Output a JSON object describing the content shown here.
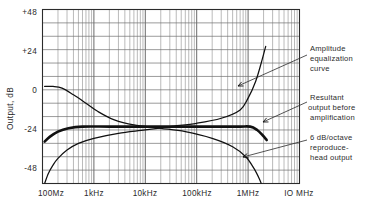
{
  "chart_data": {
    "type": "line",
    "title": "",
    "xlabel": "",
    "ylabel": "Output, dB",
    "x_scale": "log",
    "xlim": [
      100,
      10000000
    ],
    "ylim": [
      -56,
      48
    ],
    "y_major_step": 24,
    "y_minor_step": 8,
    "grid": true,
    "legend_position": "annotations-right",
    "x_tick_labels": [
      "100Mz",
      "1kHz",
      "10kHz",
      "100kHz",
      "1MHz",
      "IO MHz"
    ],
    "x_tick_values": [
      100,
      1000,
      10000,
      100000,
      1000000,
      10000000
    ],
    "y_tick_labels": [
      "+48",
      "+24",
      "0",
      "-24",
      "-48"
    ],
    "y_tick_values": [
      48,
      24,
      0,
      -24,
      -48
    ],
    "series": [
      {
        "name": "6 dB/octave reproduce-head output",
        "style": "thin",
        "points": [
          [
            110,
            -56
          ],
          [
            130,
            -50
          ],
          [
            160,
            -45
          ],
          [
            200,
            -41
          ],
          [
            300,
            -36
          ],
          [
            500,
            -32
          ],
          [
            1000,
            -29
          ],
          [
            3000,
            -26
          ],
          [
            10000,
            -24
          ],
          [
            30000,
            -22
          ],
          [
            100000,
            -20
          ],
          [
            300000,
            -17
          ],
          [
            700000,
            -12
          ],
          [
            1000000,
            -5
          ],
          [
            1400000,
            5
          ],
          [
            1800000,
            16
          ],
          [
            2200000,
            26
          ]
        ]
      },
      {
        "name": "Amplitude equalization curve",
        "style": "thin",
        "points": [
          [
            110,
            2
          ],
          [
            160,
            2
          ],
          [
            240,
            1
          ],
          [
            400,
            -3
          ],
          [
            700,
            -8
          ],
          [
            1200,
            -13
          ],
          [
            2500,
            -18
          ],
          [
            6000,
            -21
          ],
          [
            20000,
            -23
          ],
          [
            60000,
            -25
          ],
          [
            200000,
            -29
          ],
          [
            500000,
            -34
          ],
          [
            900000,
            -40
          ],
          [
            1300000,
            -47
          ],
          [
            1700000,
            -54
          ],
          [
            1900000,
            -58
          ]
        ]
      },
      {
        "name": "Resultant output before amplification",
        "style": "bold",
        "points": [
          [
            110,
            -31
          ],
          [
            140,
            -28
          ],
          [
            200,
            -25
          ],
          [
            320,
            -23
          ],
          [
            600,
            -22
          ],
          [
            2000,
            -22
          ],
          [
            10000,
            -22
          ],
          [
            100000,
            -22
          ],
          [
            600000,
            -22
          ],
          [
            1100000,
            -22
          ],
          [
            1500000,
            -24
          ],
          [
            1900000,
            -27
          ],
          [
            2300000,
            -30
          ]
        ]
      }
    ],
    "annotations": [
      {
        "id": "amplitude-equalization",
        "lines": [
          "Amplitude",
          "equalization",
          "curve"
        ],
        "text_x": 310,
        "text_y": 48,
        "leader_from": [
          307,
          55
        ],
        "leader_to": [
          238,
          86
        ]
      },
      {
        "id": "resultant-output",
        "lines": [
          "Resultant",
          "output before",
          "amplification"
        ],
        "text_x": 310,
        "text_y": 98,
        "leader_from": [
          307,
          102
        ],
        "leader_to": [
          263,
          122
        ]
      },
      {
        "id": "reproduce-head-output",
        "lines": [
          "6 dB/octave",
          "reproduce-",
          "head output"
        ],
        "text_x": 310,
        "text_y": 138,
        "leader_from": [
          307,
          140
        ],
        "leader_to": [
          243,
          157
        ]
      }
    ]
  }
}
